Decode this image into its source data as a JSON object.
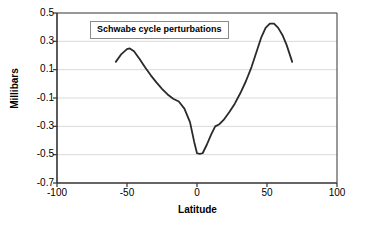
{
  "chart_data": {
    "type": "line",
    "title": "",
    "xlabel": "Latitude",
    "ylabel": "Millibars",
    "xlim": [
      -100,
      100
    ],
    "ylim": [
      -0.7,
      0.5
    ],
    "xticks": [
      "-100",
      "-50",
      "0",
      "50",
      "100"
    ],
    "xtick_values": [
      -100,
      -50,
      0,
      50,
      100
    ],
    "yticks": [
      "0.5",
      "0.3",
      "0.1",
      "-0.1",
      "-0.3",
      "-0.5",
      "-0.7"
    ],
    "ytick_values": [
      0.5,
      0.3,
      0.1,
      -0.1,
      -0.3,
      -0.5,
      -0.7
    ],
    "grid": "horizontal",
    "legend_position": "inside-top-left",
    "series": [
      {
        "name": "Schwabe cycle perturbations",
        "color": "#2b2b2b",
        "x": [
          -58,
          -54,
          -50,
          -48,
          -45,
          -41,
          -37,
          -33,
          -29,
          -25,
          -21,
          -17,
          -13,
          -9,
          -5,
          -2,
          0,
          2,
          4,
          7,
          10,
          13,
          16,
          19,
          23,
          27,
          31,
          35,
          39,
          43,
          46,
          49,
          52,
          55,
          58,
          61,
          64,
          68
        ],
        "y": [
          0.155,
          0.21,
          0.245,
          0.25,
          0.23,
          0.175,
          0.115,
          0.06,
          0.01,
          -0.035,
          -0.075,
          -0.105,
          -0.125,
          -0.175,
          -0.27,
          -0.41,
          -0.49,
          -0.495,
          -0.49,
          -0.43,
          -0.36,
          -0.3,
          -0.285,
          -0.255,
          -0.2,
          -0.14,
          -0.065,
          0.02,
          0.12,
          0.24,
          0.33,
          0.395,
          0.425,
          0.425,
          0.395,
          0.345,
          0.275,
          0.155
        ]
      }
    ],
    "annotations": [
      {
        "name": "legend-label",
        "text": "Schwabe cycle perturbations"
      }
    ]
  },
  "legend": {
    "label": "Schwabe cycle perturbations"
  },
  "axes": {
    "x_title": "Latitude",
    "y_title": "Millibars"
  }
}
